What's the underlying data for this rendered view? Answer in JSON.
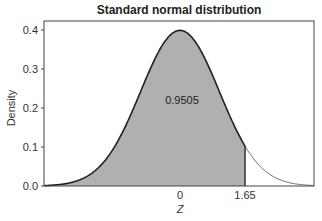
{
  "chart_data": {
    "type": "area",
    "title": "Standard normal distribution",
    "xlabel": "Z",
    "ylabel": "Density",
    "xlim": [
      -3.45,
      3.4
    ],
    "ylim": [
      0.0,
      0.42
    ],
    "yticks": [
      0.0,
      0.1,
      0.2,
      0.3,
      0.4
    ],
    "ytick_labels": [
      "0.0",
      "0.1",
      "0.2",
      "0.3",
      "0.4"
    ],
    "xticks": [
      0,
      1.65
    ],
    "xtick_labels": [
      "0",
      "1.65"
    ],
    "grid": false,
    "legend": null,
    "series": [
      {
        "name": "standard normal pdf",
        "mean": 0,
        "sd": 1,
        "line_color": "#222222"
      }
    ],
    "shaded_region": {
      "from": "-inf",
      "to": 1.65,
      "area": 0.9505,
      "fill_color": "#b0b0b0"
    },
    "annotations": [
      {
        "text": "0.9505",
        "x": 0.0,
        "y": 0.22
      }
    ]
  }
}
